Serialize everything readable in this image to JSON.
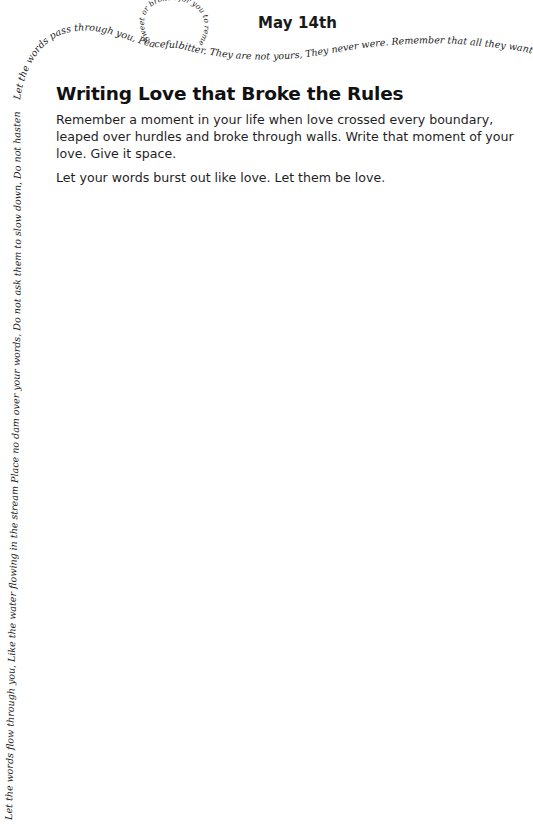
{
  "header": {
    "date": "May 14th"
  },
  "prompt": {
    "title": "Writing Love that Broke the Rules",
    "paragraphs": [
      "Remember a moment in your life when love crossed every boundary, leaped over hurdles and broke through walls. Write that moment of your love. Give it space.",
      "Let your words burst out like love. Let them be love."
    ]
  },
  "decorative_poem": {
    "left_margin": "Let the words flow through you, Like the water flowing in the stream Place no dam over your words, Do not ask them to slow down, Do not hasten them forward Allow them to move freely As they are.",
    "top_line_start": "Let the words pass through you, Peaceful and pleasant",
    "loop": "Sweet or broken for you to rememder Tender",
    "top_line_end": "bitter. They are not yours, They never were. Remember that all they want Is to reach their"
  },
  "colors": {
    "background": "#ffffff",
    "text": "#1a1a1a"
  }
}
